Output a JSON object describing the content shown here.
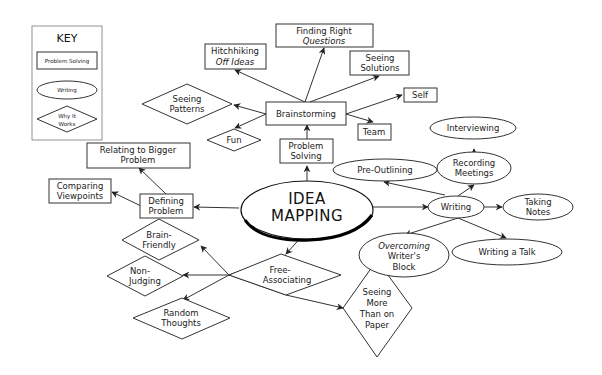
{
  "key": {
    "title": "KEY",
    "items": [
      {
        "shape": "rectangle",
        "label": "Problem Solving"
      },
      {
        "shape": "ellipse",
        "label": "Writing"
      },
      {
        "shape": "diamond",
        "label_line1": "Why It",
        "label_line2": "Works"
      }
    ]
  },
  "center": {
    "line1": "IDEA",
    "line2": "MAPPING"
  },
  "nodes": {
    "problem_solving": {
      "line1": "Problem",
      "line2": "Solving"
    },
    "brainstorming": {
      "line1": "Brainstorming"
    },
    "hitchhiking": {
      "line1": "Hitchhiking",
      "line2": "Off Ideas"
    },
    "finding_questions": {
      "line1": "Finding Right",
      "line2": "Questions"
    },
    "seeing_solutions": {
      "line1": "Seeing",
      "line2": "Solutions"
    },
    "self": {
      "line1": "Self"
    },
    "team": {
      "line1": "Team"
    },
    "seeing_patterns": {
      "line1": "Seeing",
      "line2": "Patterns"
    },
    "fun": {
      "line1": "Fun"
    },
    "defining_problem": {
      "line1": "Defining",
      "line2": "Problem"
    },
    "relating_bigger": {
      "line1": "Relating to Bigger",
      "line2": "Problem"
    },
    "comparing_viewpoints": {
      "line1": "Comparing",
      "line2": "Viewpoints"
    },
    "writing": {
      "line1": "Writing"
    },
    "pre_outlining": {
      "line1": "Pre-Outlining"
    },
    "recording_meetings": {
      "line1": "Recording",
      "line2": "Meetings"
    },
    "interviewing": {
      "line1": "Interviewing"
    },
    "taking_notes": {
      "line1": "Taking",
      "line2": "Notes"
    },
    "writing_talk": {
      "line1": "Writing a Talk"
    },
    "overcoming_block": {
      "line1": "Overcoming",
      "line2": "Writer's",
      "line3": "Block"
    },
    "free_associating": {
      "line1": "Free-",
      "line2": "Associating"
    },
    "brain_friendly": {
      "line1": "Brain-",
      "line2": "Friendly"
    },
    "non_judging": {
      "line1": "Non-",
      "line2": "Judging"
    },
    "random_thoughts": {
      "line1": "Random",
      "line2": "Thoughts"
    },
    "seeing_more": {
      "line1": "Seeing",
      "line2": "More",
      "line3": "Than on",
      "line4": "Paper"
    }
  },
  "colors": {
    "line": "#333333",
    "background": "#ffffff",
    "text": "#1a1a1a"
  }
}
